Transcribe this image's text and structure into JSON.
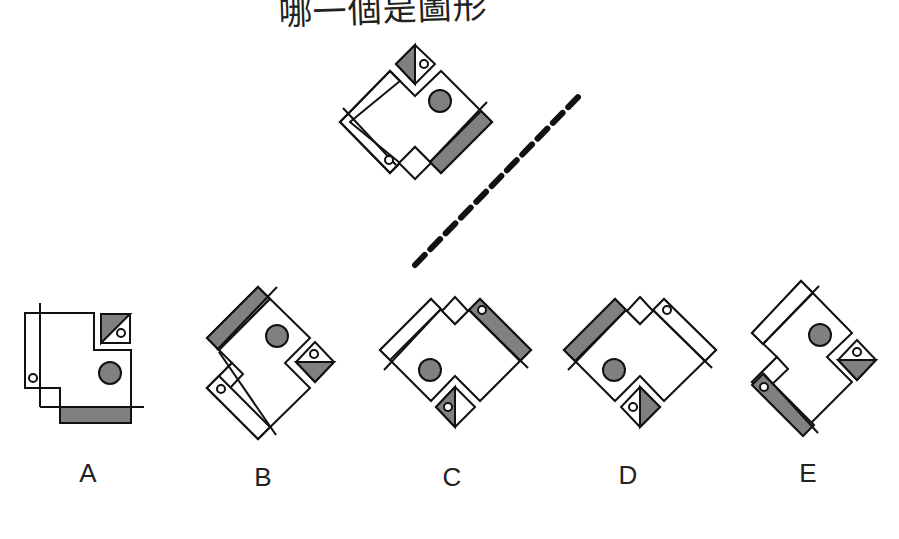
{
  "question": {
    "text": "哪一個是圖形",
    "note": "top of text is cropped in screenshot"
  },
  "colors": {
    "line": "#111111",
    "fill_gray": "#808080",
    "background": "#ffffff"
  },
  "reference_figure": {
    "description": "Tilted composite figure with mirror axis (dashed line)"
  },
  "mirror_line": {
    "style": "dashed",
    "from": [
      415,
      265
    ],
    "to": [
      580,
      95
    ]
  },
  "options": [
    {
      "label": "A"
    },
    {
      "label": "B"
    },
    {
      "label": "C"
    },
    {
      "label": "D"
    },
    {
      "label": "E"
    }
  ]
}
